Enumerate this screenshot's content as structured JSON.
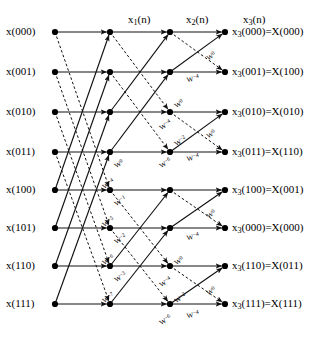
{
  "figure": {
    "kind": "fft-signal-flow-graph",
    "title": "",
    "background": "#ffffff",
    "line_color": "#111111",
    "node_color": "#000000",
    "width": 329,
    "height": 345
  },
  "stage_headers": [
    {
      "name": "x1(n)",
      "base": "x",
      "sub": "1",
      "tail": "(n)",
      "x": 128,
      "y": 14
    },
    {
      "name": "x2(n)",
      "base": "x",
      "sub": "2",
      "tail": "(n)",
      "x": 186,
      "y": 14
    },
    {
      "name": "x3(n)",
      "base": "x",
      "sub": "3",
      "tail": "(n)",
      "x": 243,
      "y": 14
    }
  ],
  "columns": {
    "input": 55,
    "s1": 110,
    "s2": 170,
    "s3": 225
  },
  "rows": [
    32,
    72,
    112,
    152,
    190,
    228,
    266,
    304
  ],
  "inputs": [
    {
      "label": "x(000)",
      "row": 0
    },
    {
      "label": "x(001)",
      "row": 1
    },
    {
      "label": "x(010)",
      "row": 2
    },
    {
      "label": "x(011)",
      "row": 3
    },
    {
      "label": "x(100)",
      "row": 4
    },
    {
      "label": "x(101)",
      "row": 5
    },
    {
      "label": "x(110)",
      "row": 6
    },
    {
      "label": "x(111)",
      "row": 7
    }
  ],
  "outputs": [
    {
      "base": "x",
      "sub": "3",
      "tail": "(000)=X(000)",
      "row": 0
    },
    {
      "base": "x",
      "sub": "3",
      "tail": "(001)=X(100)",
      "row": 1
    },
    {
      "base": "x",
      "sub": "3",
      "tail": "(010)=X(010)",
      "row": 2
    },
    {
      "base": "x",
      "sub": "3",
      "tail": "(011)=X(110)",
      "row": 3
    },
    {
      "base": "x",
      "sub": "3",
      "tail": "(100)=X(001)",
      "row": 4
    },
    {
      "base": "x",
      "sub": "3",
      "tail": "(000)=X(000)",
      "row": 5
    },
    {
      "base": "x",
      "sub": "3",
      "tail": "(110)=X(011)",
      "row": 6
    },
    {
      "base": "x",
      "sub": "3",
      "tail": "(111)=X(111)",
      "row": 7
    }
  ],
  "twiddle_labels": [
    {
      "base": "W",
      "sup": "0",
      "x": 113,
      "y": 163,
      "rot": -32
    },
    {
      "base": "W",
      "sup": "-4",
      "x": 101,
      "y": 184,
      "rot": -32
    },
    {
      "base": "W",
      "sup": "-1",
      "x": 113,
      "y": 201,
      "rot": -32
    },
    {
      "base": "W",
      "sup": "-5",
      "x": 101,
      "y": 222,
      "rot": -32
    },
    {
      "base": "W",
      "sup": "-2",
      "x": 113,
      "y": 239,
      "rot": -32
    },
    {
      "base": "W",
      "sup": "-6",
      "x": 101,
      "y": 260,
      "rot": -32
    },
    {
      "base": "W",
      "sup": "-3",
      "x": 113,
      "y": 277,
      "rot": -32
    },
    {
      "base": "W",
      "sup": "-7",
      "x": 101,
      "y": 298,
      "rot": -32
    },
    {
      "base": "W",
      "sup": "0",
      "x": 173,
      "y": 103,
      "rot": -32
    },
    {
      "base": "W",
      "sup": "-4",
      "x": 158,
      "y": 125,
      "rot": -32
    },
    {
      "base": "W",
      "sup": "-2",
      "x": 173,
      "y": 141,
      "rot": -32
    },
    {
      "base": "W",
      "sup": "-6",
      "x": 158,
      "y": 163,
      "rot": -32
    },
    {
      "base": "W",
      "sup": "0",
      "x": 173,
      "y": 260,
      "rot": -32
    },
    {
      "base": "W",
      "sup": "-4",
      "x": 158,
      "y": 282,
      "rot": -32
    },
    {
      "base": "W",
      "sup": "-2",
      "x": 173,
      "y": 298,
      "rot": -32
    },
    {
      "base": "W",
      "sup": "-6",
      "x": 158,
      "y": 320,
      "rot": -32
    },
    {
      "base": "W",
      "sup": "0",
      "x": 205,
      "y": 55,
      "rot": -30
    },
    {
      "base": "W",
      "sup": "-4",
      "x": 186,
      "y": 76,
      "rot": -12
    },
    {
      "base": "W",
      "sup": "0",
      "x": 205,
      "y": 133,
      "rot": -30
    },
    {
      "base": "W",
      "sup": "-4",
      "x": 186,
      "y": 155,
      "rot": -12
    },
    {
      "base": "W",
      "sup": "0",
      "x": 205,
      "y": 213,
      "rot": -30
    },
    {
      "base": "W",
      "sup": "-4",
      "x": 186,
      "y": 234,
      "rot": -12
    },
    {
      "base": "W",
      "sup": "0",
      "x": 205,
      "y": 290,
      "rot": -30
    },
    {
      "base": "W",
      "sup": "-4",
      "x": 186,
      "y": 312,
      "rot": -12
    }
  ],
  "edges": {
    "stage1": {
      "straight": [
        [
          0,
          0
        ],
        [
          1,
          1
        ],
        [
          2,
          2
        ],
        [
          3,
          3
        ],
        [
          4,
          4
        ],
        [
          5,
          5
        ],
        [
          6,
          6
        ],
        [
          7,
          7
        ]
      ],
      "cross_solid": [
        [
          4,
          0
        ],
        [
          5,
          1
        ],
        [
          6,
          2
        ],
        [
          7,
          3
        ]
      ],
      "cross_dashed": [
        [
          0,
          4
        ],
        [
          1,
          5
        ],
        [
          2,
          6
        ],
        [
          3,
          7
        ]
      ]
    },
    "stage2": {
      "straight": [
        [
          0,
          0
        ],
        [
          1,
          1
        ],
        [
          2,
          2
        ],
        [
          3,
          3
        ],
        [
          4,
          4
        ],
        [
          5,
          5
        ],
        [
          6,
          6
        ],
        [
          7,
          7
        ]
      ],
      "cross_solid": [
        [
          2,
          0
        ],
        [
          3,
          1
        ],
        [
          6,
          4
        ],
        [
          7,
          5
        ]
      ],
      "cross_dashed": [
        [
          0,
          2
        ],
        [
          1,
          3
        ],
        [
          4,
          6
        ],
        [
          5,
          7
        ]
      ]
    },
    "stage3": {
      "straight": [
        [
          0,
          0
        ],
        [
          1,
          1
        ],
        [
          2,
          2
        ],
        [
          3,
          3
        ],
        [
          4,
          4
        ],
        [
          5,
          5
        ],
        [
          6,
          6
        ],
        [
          7,
          7
        ]
      ],
      "cross_solid": [
        [
          1,
          0
        ],
        [
          3,
          2
        ],
        [
          5,
          4
        ],
        [
          7,
          6
        ]
      ],
      "cross_dashed": [
        [
          0,
          1
        ],
        [
          2,
          3
        ],
        [
          4,
          5
        ],
        [
          6,
          7
        ]
      ]
    }
  }
}
